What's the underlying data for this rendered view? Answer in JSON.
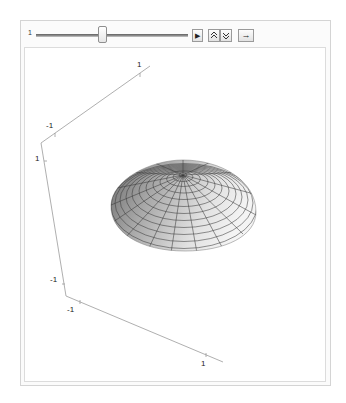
{
  "manipulator": {
    "slider_label": "1",
    "slider_position_fraction": 0.45,
    "buttons": [
      {
        "name": "play",
        "icon": "play-icon",
        "glyph": "▶"
      },
      {
        "name": "faster",
        "icon": "double-up-icon",
        "glyph": "⌃"
      },
      {
        "name": "slower",
        "icon": "double-down-icon",
        "glyph": "⌄"
      },
      {
        "name": "direction",
        "icon": "right-arrow-icon",
        "glyph": "→"
      }
    ]
  },
  "plot": {
    "type": "3d-surface",
    "surface": "paraboloid dome",
    "axes": {
      "top_axis": {
        "tick_labels": [
          "-1",
          "1"
        ]
      },
      "vertical_axis": {
        "tick_labels": [
          "1",
          "-1"
        ]
      },
      "bottom_axis": {
        "tick_labels": [
          "-1",
          "1"
        ]
      }
    },
    "colors": {
      "axis": "#9a9a9a",
      "surface_light": "#f2f2f2",
      "surface_dark": "#7a7a7a",
      "mesh": "#3a3a3a"
    }
  }
}
